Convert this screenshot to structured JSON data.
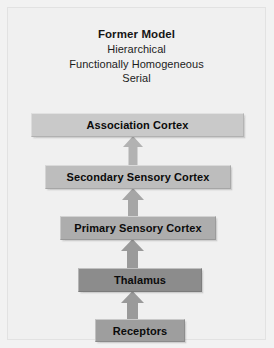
{
  "figure": {
    "title": "Former Model",
    "subtitles": [
      "Hierarchical",
      "Functionally Homogeneous",
      "Serial"
    ],
    "background_color": "#f0f0f0",
    "frame_color": "#e2e2e2",
    "text_color": "#0b0b0b"
  },
  "diagram": {
    "type": "flowchart",
    "orientation": "bottom-to-top",
    "nodes": [
      {
        "id": "association-cortex",
        "label": "Association Cortex",
        "level": 5,
        "fill": "#c9c9c9"
      },
      {
        "id": "secondary-sensory-cortex",
        "label": "Secondary Sensory Cortex",
        "level": 4,
        "fill": "#bdbdbd"
      },
      {
        "id": "primary-sensory-cortex",
        "label": "Primary Sensory Cortex",
        "level": 3,
        "fill": "#adadad"
      },
      {
        "id": "thalamus",
        "label": "Thalamus",
        "level": 2,
        "fill": "#8c8c8c"
      },
      {
        "id": "receptors",
        "label": "Receptors",
        "level": 1,
        "fill": "#9e9e9e"
      }
    ],
    "edges": [
      {
        "id": "receptors-to-thalamus",
        "from": "receptors",
        "to": "thalamus",
        "arrow": "up",
        "color": "#9a9a9a"
      },
      {
        "id": "thalamus-to-primary",
        "from": "thalamus",
        "to": "primary-sensory-cortex",
        "arrow": "up",
        "color": "#9a9a9a"
      },
      {
        "id": "primary-to-secondary",
        "from": "primary-sensory-cortex",
        "to": "secondary-sensory-cortex",
        "arrow": "up",
        "color": "#a6a6a6"
      },
      {
        "id": "secondary-to-association",
        "from": "secondary-sensory-cortex",
        "to": "association-cortex",
        "arrow": "up",
        "color": "#b2b2b2"
      }
    ]
  }
}
